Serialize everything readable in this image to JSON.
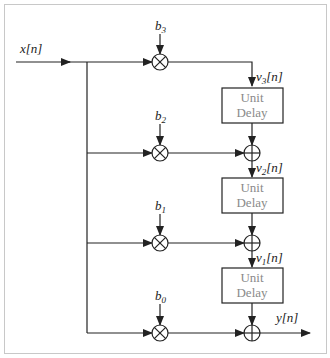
{
  "diagram": {
    "type": "FIR filter transposed direct form",
    "input_label": "x[n]",
    "output_label": "y[n]",
    "coefficients": [
      {
        "name": "b",
        "sub": "3"
      },
      {
        "name": "b",
        "sub": "2"
      },
      {
        "name": "b",
        "sub": "1"
      },
      {
        "name": "b",
        "sub": "0"
      }
    ],
    "states": [
      {
        "name": "v",
        "sub": "3",
        "suffix": "[n]"
      },
      {
        "name": "v",
        "sub": "2",
        "suffix": "[n]"
      },
      {
        "name": "v",
        "sub": "1",
        "suffix": "[n]"
      }
    ],
    "delay_blocks": [
      {
        "line1": "Unit",
        "line2": "Delay"
      },
      {
        "line1": "Unit",
        "line2": "Delay"
      },
      {
        "line1": "Unit",
        "line2": "Delay"
      }
    ],
    "colors": {
      "line": "#222222",
      "box_text": "#8a8a8a",
      "frame": "#c8c8c8"
    }
  }
}
